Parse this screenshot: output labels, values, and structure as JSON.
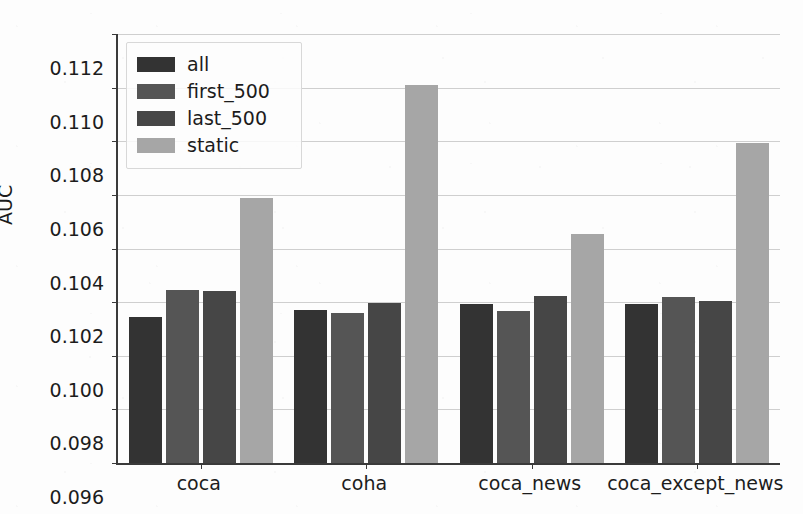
{
  "chart_data": {
    "type": "bar",
    "title": "",
    "xlabel": "",
    "ylabel": "AUC",
    "ylim": [
      0.096,
      0.112
    ],
    "ytick_labels": [
      "0.112",
      "0.110",
      "0.108",
      "0.106",
      "0.104",
      "0.102",
      "0.100",
      "0.098",
      "0.096"
    ],
    "ytick_values": [
      0.112,
      0.11,
      0.108,
      0.106,
      0.104,
      0.102,
      0.1,
      0.098,
      0.096
    ],
    "grid": true,
    "legend_position": "upper left",
    "categories": [
      "coca",
      "coha",
      "coca_news",
      "coca_except_news"
    ],
    "series": [
      {
        "name": "all",
        "color": "#333333",
        "values": [
          0.10145,
          0.10172,
          0.10193,
          0.10194
        ]
      },
      {
        "name": "first_500",
        "color": "#555555",
        "values": [
          0.10245,
          0.1016,
          0.10167,
          0.1022
        ]
      },
      {
        "name": "last_500",
        "color": "#464646",
        "values": [
          0.1024,
          0.10198,
          0.10223,
          0.10205
        ]
      },
      {
        "name": "static",
        "color": "#a6a6a6",
        "values": [
          0.10588,
          0.11011,
          0.10454,
          0.10793
        ]
      }
    ]
  }
}
